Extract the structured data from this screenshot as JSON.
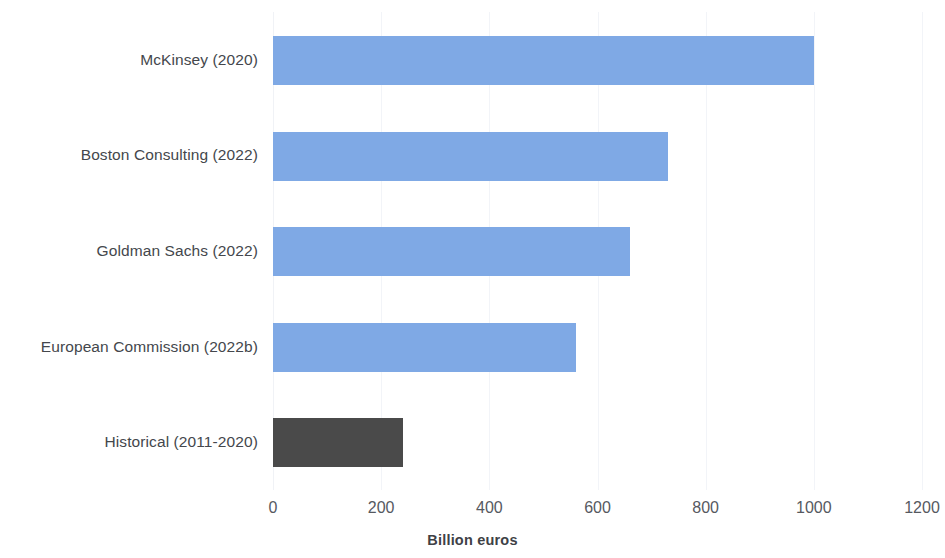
{
  "chart_data": {
    "type": "bar",
    "orientation": "horizontal",
    "title": "",
    "subtitle": "",
    "xlabel": "Billion euros",
    "ylabel": "",
    "categories": [
      "McKinsey (2020)",
      "Boston Consulting (2022)",
      "Goldman Sachs (2022)",
      "European Commission (2022b)",
      "Historical (2011-2020)"
    ],
    "values": [
      1000,
      730,
      660,
      560,
      240
    ],
    "bar_colors": [
      "#7FA9E5",
      "#7FA9E5",
      "#7FA9E5",
      "#7FA9E5",
      "#4A4A4A"
    ],
    "xlim": [
      0,
      1200
    ],
    "xticks": [
      0,
      200,
      400,
      600,
      800,
      1000,
      1200
    ],
    "xtick_labels": [
      "0",
      "200",
      "400",
      "600",
      "800",
      "1000",
      "1200"
    ],
    "grid": true,
    "grid_axis": "x",
    "grid_color": "#F2F4F8",
    "legend": null,
    "legend_position": "none",
    "annotations": [],
    "accent_color": "#7FA9E5",
    "highlight_color": "#4A4A4A",
    "background_color": "#FFFFFF",
    "text_color": "#44474C"
  }
}
